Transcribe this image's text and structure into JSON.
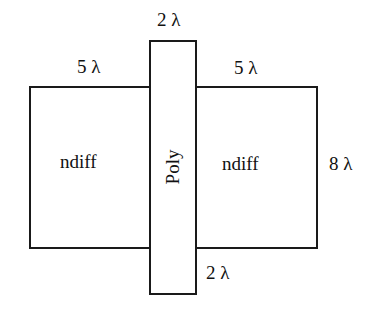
{
  "diagram": {
    "shapes": {
      "left_diffusion": {
        "label": "ndiff"
      },
      "right_diffusion": {
        "label": "ndiff"
      },
      "poly_gate": {
        "label": "Poly"
      }
    },
    "dimensions": {
      "poly_width": "2 λ",
      "left_diff_length": "5 λ",
      "right_diff_length": "5 λ",
      "diff_height": "8 λ",
      "poly_extension": "2 λ"
    }
  }
}
